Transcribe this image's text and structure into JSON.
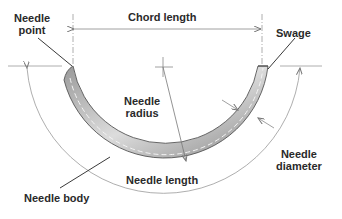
{
  "diagram": {
    "labels": {
      "needle_point": [
        "Needle",
        "point"
      ],
      "chord_length": "Chord length",
      "swage": "Swage",
      "needle_radius": [
        "Needle",
        "radius"
      ],
      "needle_body": "Needle body",
      "needle_length": "Needle length",
      "needle_diameter": [
        "Needle",
        "diameter"
      ]
    },
    "colors": {
      "ink": "#2a2a2a",
      "line": "#8a8a8a",
      "needle_shade": "#b0b0b0",
      "background": "#ffffff"
    }
  }
}
